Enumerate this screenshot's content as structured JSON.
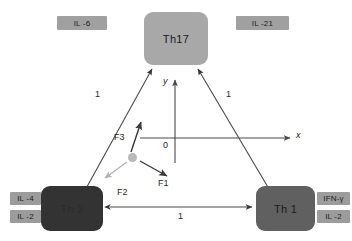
{
  "diagram": {
    "background_color": "#ffffff"
  },
  "nodes": [
    {
      "id": "th17",
      "label": "Th17",
      "fill": "#a8a8a8",
      "x": 144,
      "y": 12,
      "w": 64,
      "h": 53
    },
    {
      "id": "th2",
      "label": "Th 2",
      "fill": "#333333",
      "x": 41,
      "y": 186,
      "w": 62,
      "h": 45
    },
    {
      "id": "th1",
      "label": "Th 1",
      "fill": "#606060",
      "x": 256,
      "y": 186,
      "w": 59,
      "h": 45
    }
  ],
  "cytokines": [
    {
      "id": "il6",
      "label": "IL -6",
      "fill": "#a0a0a0",
      "x": 57,
      "y": 16,
      "w": 50,
      "h": 14
    },
    {
      "id": "il21",
      "label": "IL -21",
      "fill": "#a0a0a0",
      "x": 236,
      "y": 16,
      "w": 53,
      "h": 14
    },
    {
      "id": "il4",
      "label": "IL -4",
      "fill": "#9c9c9c",
      "x": 10,
      "y": 192,
      "w": 31,
      "h": 13
    },
    {
      "id": "il2l",
      "label": "IL -2",
      "fill": "#9c9c9c",
      "x": 10,
      "y": 210,
      "w": 31,
      "h": 13
    },
    {
      "id": "ifng",
      "label": "IFN-γ",
      "fill": "#9c9c9c",
      "x": 317,
      "y": 192,
      "w": 33,
      "h": 13
    },
    {
      "id": "il2r",
      "label": "IL -2",
      "fill": "#9c9c9c",
      "x": 317,
      "y": 210,
      "w": 33,
      "h": 13
    }
  ],
  "axes": {
    "origin_label": "0",
    "x_label": "x",
    "y_label": "y",
    "origin": {
      "x": 175,
      "y": 138
    },
    "x_end": {
      "x": 292,
      "y": 138
    },
    "y_end": {
      "x": 175,
      "y": 79
    },
    "x_min": 140,
    "y_max": 163,
    "color": "#4a4a4a"
  },
  "edges": [
    {
      "id": "th2-th17",
      "label": "1",
      "label_x": 95,
      "label_y": 94,
      "color": "#4a4a4a"
    },
    {
      "id": "th1-th17",
      "label": "1",
      "label_x": 226,
      "label_y": 94,
      "color": "#4a4a4a"
    },
    {
      "id": "th2-th1",
      "label": "1",
      "label_x": 178,
      "label_y": 214,
      "color": "#4a4a4a"
    }
  ],
  "vectors": [
    {
      "id": "f1",
      "label": "F1",
      "label_x": 161,
      "label_y": 183,
      "color": "#3a3a3a"
    },
    {
      "id": "f2",
      "label": "F2",
      "label_x": 119,
      "label_y": 192,
      "color": "#b0b0b0"
    },
    {
      "id": "f3",
      "label": "F3",
      "label_x": 117,
      "label_y": 137,
      "color": "#3a3a3a"
    }
  ],
  "particle": {
    "id": "state-dot",
    "x": 133,
    "y": 158,
    "r": 4.5,
    "color": "#b9b9b9"
  }
}
